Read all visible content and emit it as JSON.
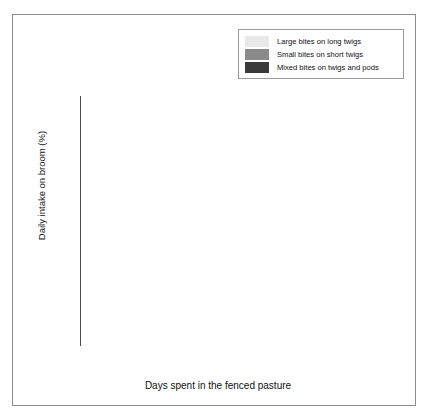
{
  "axes": {
    "y_title": "Daily intake on broom (%)",
    "x_title": "Days spent in the fenced pasture",
    "y_ticks": [
      "0.0",
      "0.2",
      "0.4",
      "0.6",
      "0.8",
      "1.0"
    ],
    "x_ticks": [
      "1",
      "3",
      "5",
      "7",
      "9",
      "11",
      "13",
      "15"
    ]
  },
  "legend": {
    "items": [
      {
        "label": "Large bites on long twigs",
        "color": "#e8e8e8"
      },
      {
        "label": "Small bites on short twigs",
        "color": "#8a8a8a"
      },
      {
        "label": "Mixed bites on twigs and pods",
        "color": "#3a3a3a"
      }
    ]
  },
  "colors": {
    "large_bites": "#e8e8e8",
    "small_bites": "#8a8a8a",
    "mixed_bites": "#3a3a3a",
    "frame": "#8c8c8c",
    "axis": "#4a4a4a",
    "background": "#ffffff"
  },
  "chart_data": {
    "type": "bar",
    "stacked": true,
    "title": "",
    "xlabel": "Days spent in the fenced pasture",
    "ylabel": "Daily intake on broom (%)",
    "ylim": [
      0,
      1
    ],
    "yticks": [
      0.0,
      0.2,
      0.4,
      0.6,
      0.8,
      1.0
    ],
    "grid": false,
    "legend_position": "top-right",
    "categories": [
      "1",
      "3",
      "5",
      "7",
      "9",
      "11",
      "13",
      "15"
    ],
    "series": [
      {
        "name": "Mixed bites on twigs and pods",
        "color": "#3a3a3a",
        "values": [
          0.855,
          0.032,
          0.005,
          0.01,
          0.006,
          0.01,
          0.008,
          0.006
        ]
      },
      {
        "name": "Small bites on short twigs",
        "color": "#8a8a8a",
        "values": [
          0.06,
          0.588,
          0.535,
          0.31,
          0.374,
          0.31,
          0.282,
          0.224
        ]
      },
      {
        "name": "Large bites on long twigs",
        "color": "#e8e8e8",
        "values": [
          0.085,
          0.38,
          0.46,
          0.68,
          0.62,
          0.68,
          0.71,
          0.77
        ]
      }
    ],
    "bar_geometry": [
      {
        "left": 12,
        "width": 48
      },
      {
        "left": 66,
        "width": 36
      },
      {
        "left": 108,
        "width": 24
      },
      {
        "left": 138,
        "width": 28
      },
      {
        "left": 172,
        "width": 22
      },
      {
        "left": 200,
        "width": 40
      },
      {
        "left": 246,
        "width": 18
      },
      {
        "left": 270,
        "width": 32
      }
    ]
  }
}
